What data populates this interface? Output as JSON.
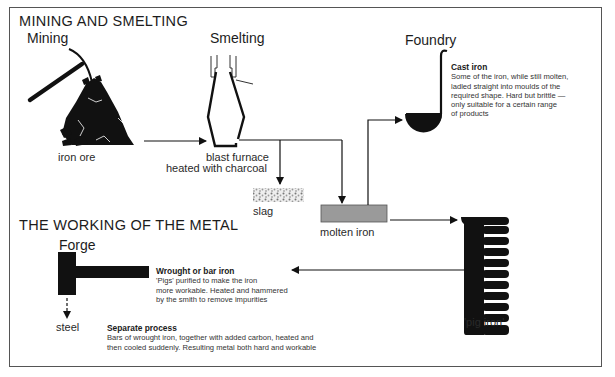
{
  "sections": {
    "mining_smelting": "MINING AND SMELTING",
    "working_metal": "THE WORKING OF THE METAL"
  },
  "stages": {
    "mining": "Mining",
    "smelting": "Smelting",
    "foundry": "Foundry",
    "forge": "Forge"
  },
  "labels": {
    "iron_ore": "iron ore",
    "blast_furnace": "blast furnace",
    "heated_charcoal": "heated with charcoal",
    "slag": "slag",
    "molten_iron": "molten iron",
    "pig_iron": "'pig iron'",
    "steel": "steel"
  },
  "notes": {
    "cast_iron": {
      "title": "Cast iron",
      "lines": [
        "Some of the iron, while still molten,",
        "ladled straight into moulds of the",
        "required shape. Hard but brittle —",
        "only suitable for a certain range",
        "of products"
      ]
    },
    "wrought_iron": {
      "title": "Wrought or bar iron",
      "lines": [
        "'Pigs' purified to make the iron",
        "more workable. Heated and hammered",
        "by the smith to remove impurities"
      ]
    },
    "separate_process": {
      "title": "Separate process",
      "lines": [
        "Bars of wrought iron, together with added carbon, heated and",
        "then cooled suddenly. Resulting metal both hard and workable"
      ]
    }
  },
  "icons": {
    "pickaxe": "pickaxe-icon",
    "ore_pile": "ore-pile-icon",
    "furnace": "blast-furnace-icon",
    "ladle": "ladle-icon",
    "pig_iron_mould": "pig-iron-mould-icon",
    "hammer": "forge-hammer-icon"
  },
  "colors": {
    "ink": "#111111",
    "molten_fill": "#9a9a9a",
    "frame": "#555555"
  }
}
